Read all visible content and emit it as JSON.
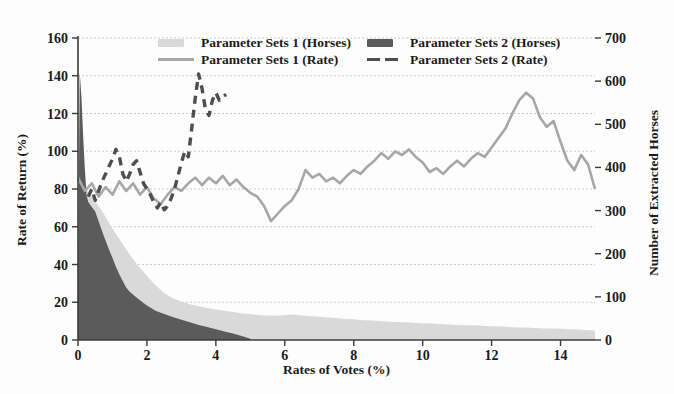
{
  "figure": {
    "background": "#fcfcfc"
  },
  "legend": {
    "items": [
      {
        "label": "Parameter Sets 1 (Horses)",
        "swatch": "area-light",
        "color": "#d9d9d9"
      },
      {
        "label": "Parameter Sets 2 (Horses)",
        "swatch": "area-dark",
        "color": "#5b5b5b"
      },
      {
        "label": "Parameter Sets 1 (Rate)",
        "swatch": "line-solid",
        "color": "#a7a7a7"
      },
      {
        "label": "Parameter Sets 2 (Rate)",
        "swatch": "line-dashed",
        "color": "#4e4e4e"
      }
    ]
  },
  "chart_data": {
    "type": "area",
    "subtype": "combo-area-line-dual-axis",
    "title": "",
    "xlabel": "Rates of Votes (%)",
    "ylabel_left": "Rate of Return (%)",
    "ylabel_right": "Number of Extracted Horses",
    "xlim": [
      0,
      15
    ],
    "x_ticks": [
      0,
      2,
      4,
      6,
      8,
      10,
      12,
      14
    ],
    "ylim_left": [
      0,
      160
    ],
    "yticks_left": [
      0,
      20,
      40,
      60,
      80,
      100,
      120,
      140,
      160
    ],
    "ylim_right": [
      0,
      700
    ],
    "yticks_right": [
      0,
      100,
      200,
      300,
      400,
      500,
      600,
      700
    ],
    "grid": "horizontal-at-left-ticks",
    "grid_color": "#cccccc",
    "legend_position": "top-center-inside",
    "series": [
      {
        "name": "Parameter Sets 1 (Horses)",
        "id": "ps1-horses-area",
        "kind": "area",
        "axis": "right",
        "color": "#d9d9d9",
        "x": [
          0,
          0.25,
          0.5,
          0.75,
          1,
          1.25,
          1.5,
          1.75,
          2,
          2.25,
          2.5,
          2.75,
          3,
          3.25,
          3.5,
          3.75,
          4,
          4.25,
          4.5,
          4.75,
          5,
          5.25,
          5.5,
          5.75,
          6,
          6.25,
          6.5,
          6.75,
          7,
          7.25,
          7.5,
          7.75,
          8,
          8.25,
          8.5,
          8.75,
          9,
          9.25,
          9.5,
          9.75,
          10,
          10.25,
          10.5,
          10.75,
          11,
          11.25,
          11.5,
          11.75,
          12,
          12.25,
          12.5,
          12.75,
          13,
          13.25,
          13.5,
          13.75,
          14,
          14.25,
          14.5,
          14.75,
          15
        ],
        "y": [
          360,
          348,
          322,
          292,
          258,
          228,
          198,
          172,
          148,
          127,
          109,
          97,
          89,
          83,
          78,
          74,
          71,
          68,
          65,
          62,
          60,
          58,
          57,
          56,
          58,
          59,
          57,
          55,
          54,
          52,
          51,
          49,
          48,
          46,
          45,
          44,
          43,
          42,
          41,
          40,
          39,
          38,
          37,
          36,
          35,
          34,
          34,
          33,
          32,
          31,
          30,
          29,
          29,
          28,
          27,
          27,
          26,
          25,
          24,
          23,
          22
        ]
      },
      {
        "name": "Parameter Sets 2 (Horses)",
        "id": "ps2-horses-area",
        "kind": "area",
        "axis": "right",
        "color": "#5b5b5b",
        "x": [
          0,
          0.05,
          0.1,
          0.15,
          0.2,
          0.25,
          0.3,
          0.4,
          0.5,
          0.6,
          0.7,
          0.8,
          0.9,
          1,
          1.1,
          1.2,
          1.3,
          1.4,
          1.5,
          1.75,
          2,
          2.25,
          2.5,
          2.75,
          3,
          3.25,
          3.5,
          3.75,
          4,
          4.25,
          4.5,
          4.75,
          5
        ],
        "y": [
          90,
          620,
          565,
          470,
          395,
          335,
          320,
          308,
          298,
          275,
          252,
          230,
          210,
          190,
          170,
          152,
          136,
          121,
          112,
          95,
          80,
          68,
          60,
          53,
          47,
          41,
          35,
          30,
          25,
          20,
          15,
          9,
          3
        ]
      },
      {
        "name": "Parameter Sets 1 (Rate)",
        "id": "ps1-rate-line",
        "kind": "line",
        "axis": "left",
        "color": "#a7a7a7",
        "width": 2.6,
        "x_start": 0,
        "x_step": 0.2,
        "y": [
          86,
          79,
          83,
          76,
          81,
          77,
          84,
          79,
          83,
          77,
          81,
          75,
          72,
          77,
          81,
          79,
          83,
          86,
          82,
          86,
          83,
          87,
          82,
          85,
          81,
          78,
          76,
          71,
          63,
          67,
          71,
          74,
          80,
          90,
          86,
          88,
          84,
          86,
          83,
          87,
          90,
          88,
          92,
          95,
          99,
          96,
          100,
          98,
          101,
          97,
          94,
          89,
          91,
          88,
          92,
          95,
          92,
          96,
          99,
          97,
          102,
          107,
          112,
          120,
          127,
          131,
          128,
          118,
          113,
          116,
          105,
          95,
          90,
          98,
          93,
          80
        ]
      },
      {
        "name": "Parameter Sets 2 (Rate)",
        "id": "ps2-rate-line",
        "kind": "line",
        "axis": "left",
        "color": "#4e4e4e",
        "width": 3.4,
        "dash": "8,6",
        "x_start": 0.3,
        "x_step": 0.1,
        "y": [
          76,
          80,
          74,
          79,
          84,
          88,
          92,
          96,
          101,
          97,
          88,
          84,
          88,
          93,
          95,
          89,
          83,
          80,
          77,
          73,
          70,
          73,
          69,
          71,
          75,
          80,
          87,
          94,
          100,
          97,
          112,
          128,
          141,
          133,
          122,
          119,
          127,
          131,
          127,
          129,
          130
        ]
      }
    ]
  }
}
